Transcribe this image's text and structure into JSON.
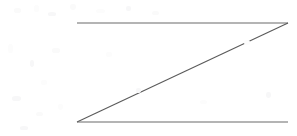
{
  "figure": {
    "title": "Z-shaped line drawing",
    "canvas": {
      "width": 297,
      "height": 136,
      "background_color": "#ffffff"
    },
    "stroke": {
      "color": "#6b6b6b",
      "diagonal_color": "#5a5a5a",
      "width": 1.1,
      "linecap": "butt"
    },
    "vertices": {
      "top_left": {
        "x": 77,
        "y": 23,
        "label": "A"
      },
      "top_right": {
        "x": 288,
        "y": 23,
        "label": "B"
      },
      "bottom_left": {
        "x": 77,
        "y": 122,
        "label": "C"
      },
      "bottom_right": {
        "x": 288,
        "y": 122,
        "label": "D"
      }
    },
    "strokes": [
      {
        "name": "top-horizontal-line",
        "x1": 77,
        "y1": 23,
        "x2": 288,
        "y2": 23,
        "length": 211,
        "orientation": "horizontal"
      },
      {
        "name": "diagonal-line",
        "x1": 288,
        "y1": 23,
        "x2": 77,
        "y2": 122,
        "length": 233,
        "orientation": "diagonal"
      },
      {
        "name": "bottom-horizontal-line",
        "x1": 77,
        "y1": 122,
        "x2": 288,
        "y2": 122,
        "length": 211,
        "orientation": "horizontal"
      }
    ],
    "artifacts": [
      {
        "x": 14,
        "y": 8,
        "w": 7,
        "h": 5,
        "shade": "s1"
      },
      {
        "x": 34,
        "y": 5,
        "w": 5,
        "h": 7,
        "shade": "s3"
      },
      {
        "x": 48,
        "y": 12,
        "w": 8,
        "h": 4,
        "shade": "s2"
      },
      {
        "x": 70,
        "y": 4,
        "w": 6,
        "h": 6,
        "shade": "s1"
      },
      {
        "x": 96,
        "y": 9,
        "w": 9,
        "h": 4,
        "shade": "s3"
      },
      {
        "x": 126,
        "y": 6,
        "w": 5,
        "h": 5,
        "shade": "s2"
      },
      {
        "x": 152,
        "y": 11,
        "w": 7,
        "h": 4,
        "shade": "s1"
      },
      {
        "x": 8,
        "y": 44,
        "w": 5,
        "h": 9,
        "shade": "s3"
      },
      {
        "x": 30,
        "y": 60,
        "w": 4,
        "h": 7,
        "shade": "s2"
      },
      {
        "x": 52,
        "y": 48,
        "w": 8,
        "h": 5,
        "shade": "s1"
      },
      {
        "x": 41,
        "y": 80,
        "w": 6,
        "h": 5,
        "shade": "s3"
      },
      {
        "x": 12,
        "y": 96,
        "w": 9,
        "h": 5,
        "shade": "s2"
      },
      {
        "x": 36,
        "y": 112,
        "w": 7,
        "h": 4,
        "shade": "s1"
      },
      {
        "x": 58,
        "y": 104,
        "w": 5,
        "h": 6,
        "shade": "s3"
      },
      {
        "x": 20,
        "y": 126,
        "w": 8,
        "h": 4,
        "shade": "s2"
      },
      {
        "x": 106,
        "y": 52,
        "w": 6,
        "h": 5,
        "shade": "s3"
      },
      {
        "x": 136,
        "y": 88,
        "w": 5,
        "h": 5,
        "shade": "s2"
      },
      {
        "x": 200,
        "y": 100,
        "w": 7,
        "h": 4,
        "shade": "s3"
      },
      {
        "x": 244,
        "y": 40,
        "w": 6,
        "h": 5,
        "shade": "s3"
      },
      {
        "x": 266,
        "y": 92,
        "w": 5,
        "h": 6,
        "shade": "s2"
      }
    ]
  }
}
